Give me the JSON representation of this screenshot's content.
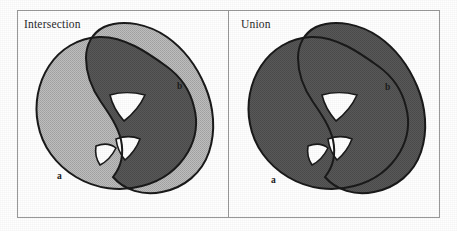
{
  "figure": {
    "type": "set-operation-diagram",
    "background_color": "#ffffff",
    "frame": {
      "border_color": "#9a9a9a",
      "border_width_px": 1,
      "x": 17,
      "y": 10,
      "width": 423,
      "height": 208,
      "divider_x": 228
    },
    "colors": {
      "outline": "#1a1a1a",
      "light_fill": "#b5b5b5",
      "dark_fill": "#555555",
      "hole_fill": "#ffffff",
      "text": "#2a2a2a"
    },
    "panels": [
      {
        "id": "intersection",
        "title": "Intersection",
        "operation": "a ∩ b",
        "shape_labels": {
          "a": "a",
          "b": "b"
        },
        "fill_legend": {
          "light_fill_meaning": "union area / non-intersecting parts",
          "dark_fill_meaning": "intersection of a and b",
          "white_meaning": "holes (excluded from both)"
        },
        "dark_region_count": 3,
        "hole_count": 3
      },
      {
        "id": "union",
        "title": "Union",
        "operation": "a ∪ b",
        "shape_labels": {
          "a": "a",
          "b": "b"
        },
        "fill_legend": {
          "dark_fill_meaning": "union of a and b",
          "white_meaning": "holes (excluded from both)"
        },
        "dark_region_count": 1,
        "hole_count": 3
      }
    ]
  }
}
